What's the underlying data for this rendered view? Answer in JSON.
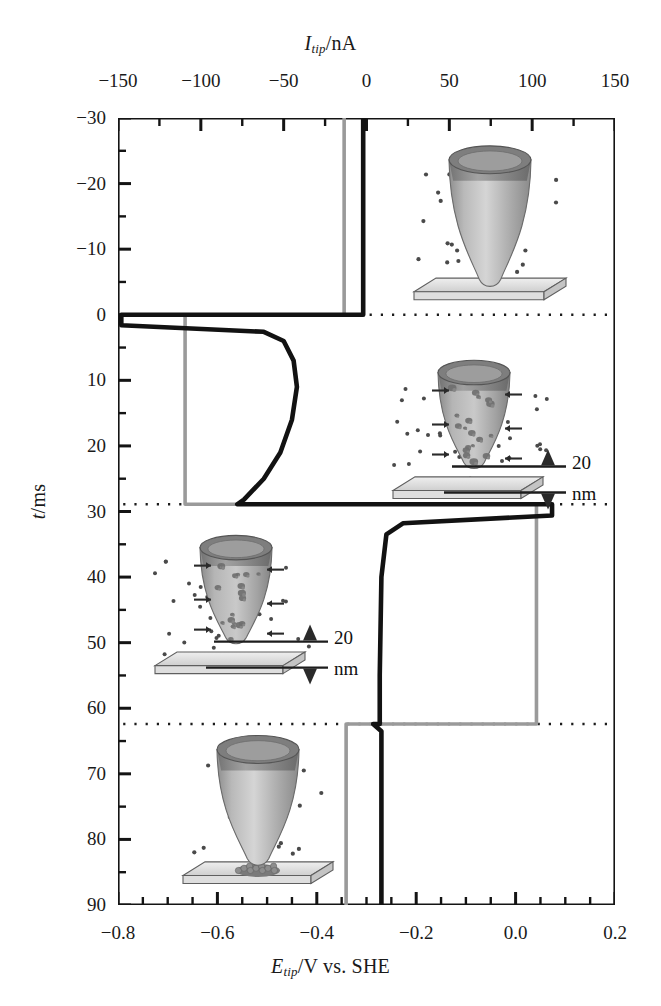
{
  "figure": {
    "top_axis_title_main": "I",
    "top_axis_title_sub": "tip",
    "top_axis_title_unit": "/nA",
    "bottom_axis_title_main": "E",
    "bottom_axis_title_sub": "tip",
    "bottom_axis_title_unit": "/V vs. SHE",
    "left_axis_title_main": "t",
    "left_axis_title_unit": "/ms"
  },
  "annotations": {
    "gap_value": "20",
    "gap_unit": "nm"
  },
  "chart_data": {
    "type": "line",
    "xlabel": "E_tip/V vs. SHE",
    "x2label": "I_tip/nA",
    "ylabel": "t/ms",
    "grid": false,
    "legend": "none",
    "y_axis_inverted": true,
    "ylim": [
      -30,
      90
    ],
    "yticks": [
      -30,
      -20,
      -10,
      0,
      10,
      20,
      30,
      40,
      50,
      60,
      70,
      80,
      90
    ],
    "ytick_labels": [
      "-30",
      "-20",
      "-10",
      "0",
      "10",
      "20",
      "30",
      "40",
      "50",
      "60",
      "70",
      "80",
      "90"
    ],
    "y_minor_step": 5,
    "xlim_bottom": [
      -0.8,
      0.2
    ],
    "xticks_bottom": [
      -0.8,
      -0.6,
      -0.4,
      -0.2,
      0.0,
      0.2
    ],
    "xtick_labels_bottom": [
      "-0.8",
      "-0.6",
      "-0.4",
      "-0.2",
      "0.0",
      "0.2"
    ],
    "x_bottom_minor_step": 0.05,
    "xlim_top": [
      -150,
      150
    ],
    "xticks_top": [
      -150,
      -100,
      -50,
      0,
      50,
      100,
      150
    ],
    "xtick_labels_top": [
      "-150",
      "-100",
      "-50",
      "0",
      "50",
      "100",
      "150"
    ],
    "x_top_minor_step": 25,
    "series": [
      {
        "name": "E_tip (potential)",
        "color": "#9a9a9a",
        "axis": "bottom",
        "units": "V",
        "points": [
          {
            "t": -30,
            "x": -0.345
          },
          {
            "t": 0.0,
            "x": -0.345
          },
          {
            "t": 0.0,
            "x": -0.665
          },
          {
            "t": 28.9,
            "x": -0.665
          },
          {
            "t": 28.9,
            "x": 0.042
          },
          {
            "t": 62.4,
            "x": 0.042
          },
          {
            "t": 62.4,
            "x": -0.341
          },
          {
            "t": 90,
            "x": -0.341
          }
        ]
      },
      {
        "name": "I_tip (current)",
        "color": "#121212",
        "axis": "top",
        "units": "nA",
        "points": [
          {
            "t": -30,
            "i": -2
          },
          {
            "t": 0.0,
            "i": -2
          },
          {
            "t": 0.0,
            "i": -148
          },
          {
            "t": 1.6,
            "i": -148
          },
          {
            "t": 2.6,
            "i": -62
          },
          {
            "t": 4.0,
            "i": -50
          },
          {
            "t": 7.0,
            "i": -44
          },
          {
            "t": 11.0,
            "i": -42
          },
          {
            "t": 16.0,
            "i": -45
          },
          {
            "t": 21.0,
            "i": -52
          },
          {
            "t": 25.0,
            "i": -62
          },
          {
            "t": 28.2,
            "i": -74
          },
          {
            "t": 28.9,
            "i": -78
          },
          {
            "t": 28.9,
            "i": 112
          },
          {
            "t": 30.6,
            "i": 112
          },
          {
            "t": 31.8,
            "i": 22
          },
          {
            "t": 33.5,
            "i": 12
          },
          {
            "t": 40.0,
            "i": 9
          },
          {
            "t": 55.0,
            "i": 8
          },
          {
            "t": 62.4,
            "i": 8
          },
          {
            "t": 62.4,
            "i": 4
          },
          {
            "t": 63.5,
            "i": 9
          },
          {
            "t": 90.0,
            "i": 9
          }
        ]
      }
    ],
    "event_markers": {
      "description": "Dotted horizontal reference lines marking potential-step events",
      "values": [
        0.0,
        28.9,
        62.4
      ],
      "style": "dotted"
    },
    "inset_illustrations": [
      {
        "id": "tip-clean-before",
        "t_center": -15,
        "caption": "Clean tip above substrate with ions in solution"
      },
      {
        "id": "tip-dissolving-upper",
        "t_center": 15,
        "caption": "Tip with deposits dissolving, arrows showing flux, 20 nm gap"
      },
      {
        "id": "tip-dissolving-lower",
        "t_center": 45,
        "caption": "Tip with deposits dissolving, arrows showing flux, 20 nm gap"
      },
      {
        "id": "tip-clean-after",
        "t_center": 78,
        "caption": "Clean tip above substrate bearing a nanoparticle deposit"
      }
    ]
  }
}
